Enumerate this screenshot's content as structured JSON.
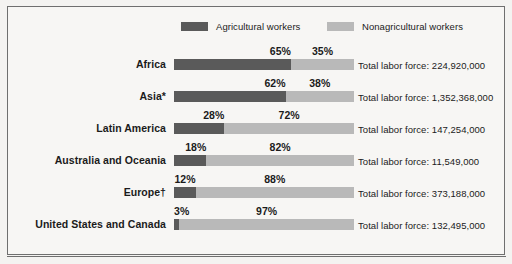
{
  "legend": {
    "agricultural_label": "Agricultural workers",
    "nonagricultural_label": "Nonagricultural workers",
    "agricultural_color": "#5a5a5a",
    "nonagricultural_color": "#b9b9b9"
  },
  "total_prefix": "Total labor force: ",
  "rows": [
    {
      "label": "Africa",
      "agricultural_pct": "65%",
      "nonagricultural_pct": "35%",
      "total": "Total labor force: 224,920,000"
    },
    {
      "label": "Asia*",
      "agricultural_pct": "62%",
      "nonagricultural_pct": "38%",
      "total": "Total labor force: 1,352,368,000"
    },
    {
      "label": "Latin America",
      "agricultural_pct": "28%",
      "nonagricultural_pct": "72%",
      "total": "Total labor force: 147,254,000"
    },
    {
      "label": "Australia and Oceania",
      "agricultural_pct": "18%",
      "nonagricultural_pct": "82%",
      "total": "Total labor force: 11,549,000"
    },
    {
      "label": "Europe†",
      "agricultural_pct": "12%",
      "nonagricultural_pct": "88%",
      "total": "Total labor force: 373,188,000"
    },
    {
      "label": "United States and Canada",
      "agricultural_pct": "3%",
      "nonagricultural_pct": "97%",
      "total": "Total labor force: 132,495,000"
    }
  ],
  "chart_data": {
    "type": "bar",
    "subtype": "stacked-horizontal-100pct",
    "title": "",
    "xlabel": "",
    "ylabel": "",
    "xlim": [
      0,
      100
    ],
    "grid": false,
    "legend_position": "top",
    "categories": [
      "Africa",
      "Asia*",
      "Latin America",
      "Australia and Oceania",
      "Europe†",
      "United States and Canada"
    ],
    "series": [
      {
        "name": "Agricultural workers",
        "color": "#5a5a5a",
        "values": [
          65,
          62,
          28,
          18,
          12,
          3
        ]
      },
      {
        "name": "Nonagricultural workers",
        "color": "#b9b9b9",
        "values": [
          35,
          38,
          72,
          82,
          88,
          97
        ]
      }
    ],
    "annotations": [
      {
        "category": "Africa",
        "text": "Total labor force: 224,920,000",
        "value": 224920000
      },
      {
        "category": "Asia*",
        "text": "Total labor force: 1,352,368,000",
        "value": 1352368000
      },
      {
        "category": "Latin America",
        "text": "Total labor force: 147,254,000",
        "value": 147254000
      },
      {
        "category": "Australia and Oceania",
        "text": "Total labor force: 11,549,000",
        "value": 11549000
      },
      {
        "category": "Europe†",
        "text": "Total labor force: 373,188,000",
        "value": 373188000
      },
      {
        "category": "United States and Canada",
        "text": "Total labor force: 132,495,000",
        "value": 132495000
      }
    ]
  }
}
